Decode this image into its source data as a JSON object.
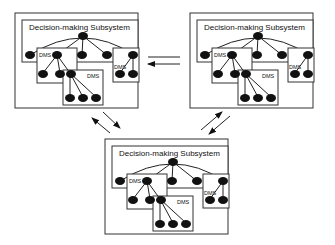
{
  "diagram": {
    "panels": [
      {
        "id": "top-left",
        "x": 15,
        "y": 13,
        "title": "Decision-making Subsystem",
        "dms_labels": [
          "DMS",
          "DMS",
          "DMS"
        ]
      },
      {
        "id": "top-right",
        "x": 190,
        "y": 13,
        "title": "Decision-making Subsystem",
        "dms_labels": [
          "DMS",
          "DMS",
          "DMS"
        ]
      },
      {
        "id": "bottom",
        "x": 105,
        "y": 139,
        "title": "Decision-making Subsystem",
        "dms_labels": [
          "DMS",
          "DMS",
          "DMS"
        ]
      }
    ],
    "connections": [
      {
        "from": "top-left",
        "to": "top-right",
        "type": "bidirectional"
      },
      {
        "from": "top-left",
        "to": "bottom",
        "type": "bidirectional"
      },
      {
        "from": "top-right",
        "to": "bottom",
        "type": "bidirectional"
      }
    ],
    "colors": {
      "line": "#222222",
      "node": "#111111",
      "background": "#ffffff"
    }
  },
  "labels": {
    "panel_title": "Decision-making Subsystem",
    "dms": "DMS"
  }
}
